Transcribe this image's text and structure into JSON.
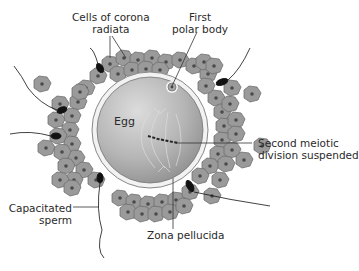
{
  "diagram": {
    "type": "Oocyte at ovulation surrounded by corona radiata and sperm",
    "labels": {
      "corona_line1": "Cells of corona",
      "corona_line2": "radiata",
      "polar_line1": "First",
      "polar_line2": "polar body",
      "egg": "Egg",
      "meiotic_line1": "Second meiotic",
      "meiotic_line2": "division suspended",
      "sperm_line1": "Capacitated",
      "sperm_line2": "sperm",
      "zona": "Zona pellucida"
    },
    "colors": {
      "egg_fill": "#b8b8b8",
      "zona": "#f2f2f2",
      "cell_fill": "#9a9a9a",
      "cell_stroke": "#6e6e6e",
      "nucleus": "#4a4a4a",
      "sperm": "#111111",
      "leader_line": "#333333"
    }
  }
}
